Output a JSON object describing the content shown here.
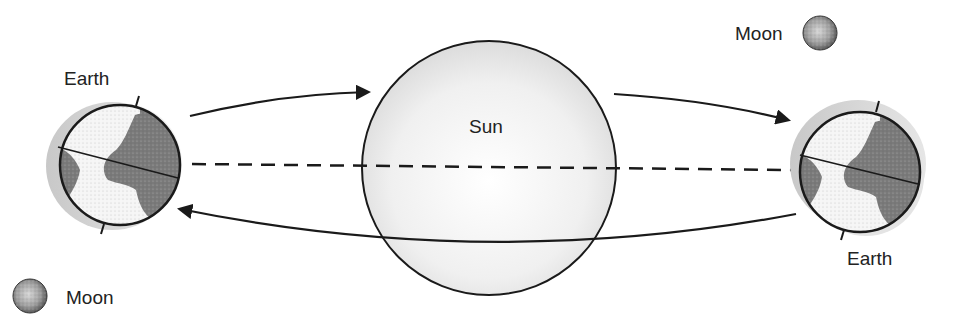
{
  "diagram": {
    "type": "sun-earth-moon-orbit",
    "labels": {
      "earth_left": "Earth",
      "earth_right": "Earth",
      "sun": "Sun",
      "moon_top": "Moon",
      "moon_bottom": "Moon"
    },
    "bodies": {
      "sun": {
        "cx": 489,
        "cy": 168,
        "r": 127
      },
      "earth_left": {
        "cx": 120,
        "cy": 165,
        "r": 60
      },
      "earth_right": {
        "cx": 860,
        "cy": 172,
        "r": 60
      },
      "moon_top": {
        "cx": 820,
        "cy": 33,
        "r": 17
      },
      "moon_bottom": {
        "cx": 30,
        "cy": 296,
        "r": 17
      }
    },
    "arrows": [
      {
        "id": "top-left-to-sun",
        "direction": "toward-sun"
      },
      {
        "id": "top-sun-to-right",
        "direction": "toward-right-earth"
      },
      {
        "id": "bottom-right-to-left",
        "direction": "toward-left-earth"
      }
    ],
    "ecliptic_line": "dashed",
    "colors": {
      "outline": "#1a1a1a",
      "land": "#7a7a7a",
      "ocean": "#f4f4f4",
      "sun_fill": "#ebebeb",
      "shadow_crescent": "#d4d4d4",
      "moon_fill": "#9a9a9a"
    }
  }
}
